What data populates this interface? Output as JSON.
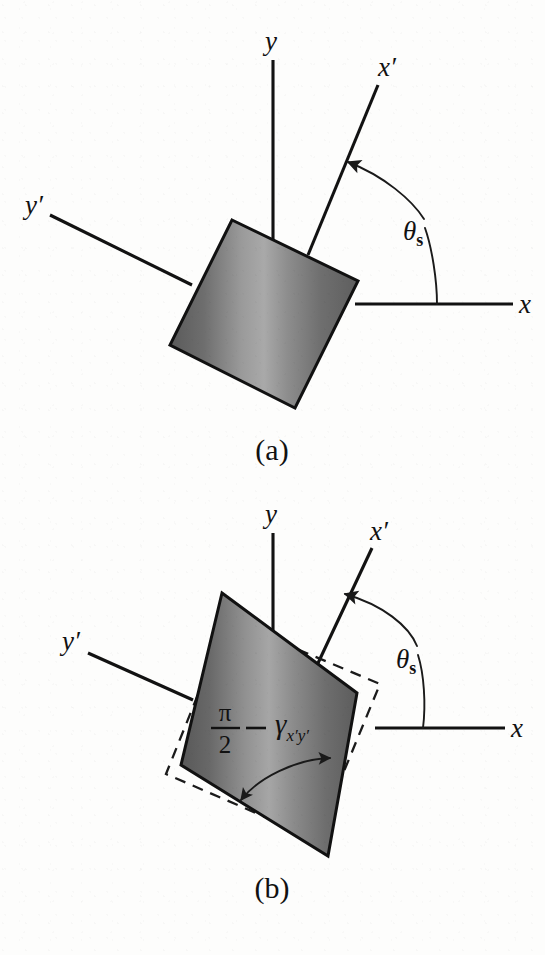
{
  "figure": {
    "title_semantic": "shear-deformation-rotated-axes",
    "background_color": "#fdfdfc",
    "ink_color": "#111111"
  },
  "panels": [
    {
      "id": "a",
      "caption": "(a)",
      "description": "Undeformed square element with rotated primed axes",
      "axes": [
        {
          "name": "y",
          "label": "y",
          "label_style": "italic"
        },
        {
          "name": "x",
          "label": "x",
          "label_style": "italic"
        },
        {
          "name": "x-prime",
          "label": "x′",
          "label_style": "italic"
        },
        {
          "name": "y-prime",
          "label": "y′",
          "label_style": "italic"
        }
      ],
      "angle_label": {
        "symbol": "θ",
        "subscript": "s"
      },
      "element_shape": "square",
      "element_fill": "gradient-gray"
    },
    {
      "id": "b",
      "caption": "(b)",
      "description": "Sheared element with dashed undeformed reference outline",
      "axes": [
        {
          "name": "y",
          "label": "y",
          "label_style": "italic"
        },
        {
          "name": "x",
          "label": "x",
          "label_style": "italic"
        },
        {
          "name": "x-prime",
          "label": "x′",
          "label_style": "italic"
        },
        {
          "name": "y-prime",
          "label": "y′",
          "label_style": "italic"
        }
      ],
      "angle_label": {
        "symbol": "θ",
        "subscript": "s"
      },
      "shear_angle_label": {
        "numerator": "π",
        "denominator": "2",
        "operator": "−",
        "symbol": "γ",
        "subscript": "x′y′"
      },
      "element_shape": "sheared-quadrilateral",
      "element_fill": "gradient-gray",
      "reference_outline": "dashed-square"
    }
  ]
}
